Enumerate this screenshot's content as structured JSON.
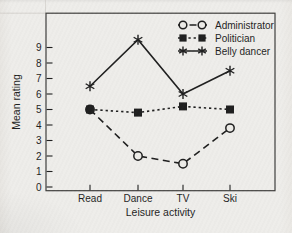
{
  "figure": {
    "paper_color": "#edece8",
    "ink_color": "#1f1f1f",
    "frame_color": "#3f3e3c"
  },
  "chart_data": {
    "type": "line",
    "title": "",
    "xlabel": "Leisure activity",
    "ylabel": "Mean rating",
    "categories": [
      "Read",
      "Dance",
      "TV",
      "Ski"
    ],
    "series": [
      {
        "name": "Administrator",
        "marker": "open-circle",
        "line_style": "dashed",
        "values": [
          5.0,
          2.0,
          1.5,
          3.8
        ]
      },
      {
        "name": "Politician",
        "marker": "filled-square",
        "line_style": "dotted",
        "values": [
          5.0,
          4.8,
          5.2,
          5.0
        ]
      },
      {
        "name": "Belly dancer",
        "marker": "asterisk",
        "line_style": "solid",
        "values": [
          6.5,
          9.5,
          6.0,
          7.5
        ]
      }
    ],
    "yticks": [
      0,
      1,
      2,
      3,
      4,
      5,
      6,
      7,
      8,
      9
    ],
    "ylim": [
      0,
      11.3
    ],
    "grid": false,
    "legend_position": "top-right"
  }
}
